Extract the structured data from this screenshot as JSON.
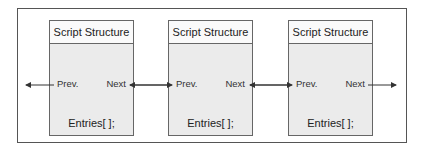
{
  "diagram": {
    "type": "doubly-linked-list",
    "nodes": [
      {
        "title": "Script Structure",
        "prev_label": "Prev.",
        "next_label": "Next",
        "entries_label": "Entries[ ];"
      },
      {
        "title": "Script Structure",
        "prev_label": "Prev.",
        "next_label": "Next",
        "entries_label": "Entries[ ];"
      },
      {
        "title": "Script Structure",
        "prev_label": "Prev.",
        "next_label": "Next",
        "entries_label": "Entries[ ];"
      }
    ],
    "links": [
      {
        "from": "outside-left",
        "to": "node-1.prev",
        "direction": "left"
      },
      {
        "from": "node-1.next",
        "to": "node-2.prev",
        "direction": "bidirectional"
      },
      {
        "from": "node-2.next",
        "to": "node-3.prev",
        "direction": "bidirectional"
      },
      {
        "from": "node-3.next",
        "to": "outside-right",
        "direction": "right"
      }
    ],
    "colors": {
      "line": "#333333",
      "node_fill": "#ebebeb",
      "header_fill": "#fafafa",
      "border": "#666666"
    }
  }
}
